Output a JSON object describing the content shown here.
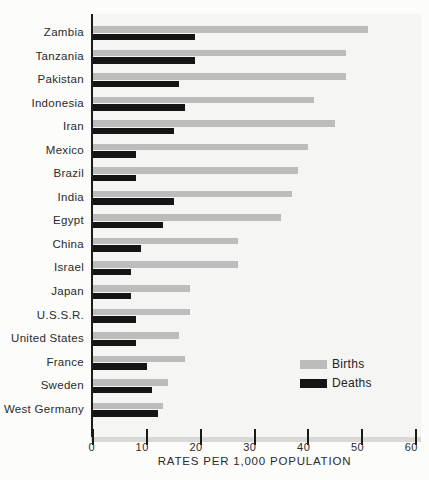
{
  "chart_data": {
    "type": "bar",
    "orientation": "horizontal",
    "title": "",
    "xlabel": "RATES PER 1,000 POPULATION",
    "xlim": [
      0,
      60
    ],
    "xticks": [
      0,
      10,
      20,
      30,
      40,
      50,
      60
    ],
    "grid": false,
    "legend_position": "inside-bottom-right",
    "categories": [
      "Zambia",
      "Tanzania",
      "Pakistan",
      "Indonesia",
      "Iran",
      "Mexico",
      "Brazil",
      "India",
      "Egypt",
      "China",
      "Israel",
      "Japan",
      "U.S.S.R.",
      "United States",
      "France",
      "Sweden",
      "West Germany"
    ],
    "series": [
      {
        "name": "Births",
        "color": "#bcbcbc",
        "values": [
          51,
          47,
          47,
          41,
          45,
          40,
          38,
          37,
          35,
          27,
          27,
          18,
          18,
          16,
          17,
          14,
          13
        ]
      },
      {
        "name": "Deaths",
        "color": "#151515",
        "values": [
          19,
          19,
          16,
          17,
          15,
          8,
          8,
          15,
          13,
          9,
          7,
          7,
          8,
          8,
          10,
          11,
          12
        ]
      }
    ]
  },
  "axis": {
    "tick_labels": [
      "0",
      "10",
      "20",
      "30",
      "40",
      "50",
      "60"
    ],
    "caption": "RATES PER 1,000 POPULATION"
  },
  "legend": {
    "births_label": "Births",
    "deaths_label": "Deaths"
  },
  "colors": {
    "births": "#bcbcbc",
    "deaths": "#151515",
    "plot_bg": "#f5f5f3",
    "axis_band": "#d8d8d6",
    "axis_line": "#1c1c1c",
    "page_bg": "#fcfcfb",
    "text": "#2b2b2b"
  }
}
